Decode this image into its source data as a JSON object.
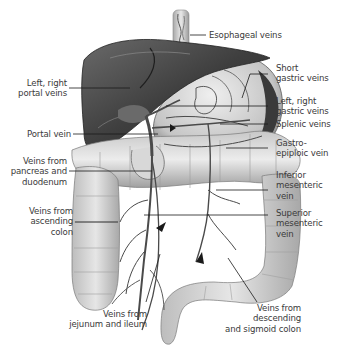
{
  "diagram": {
    "labels": {
      "esophageal": "Esophageal veins",
      "left_right_portal": "Left, right\nportal veins",
      "short_gastric": "Short\ngastric veins",
      "left_right_gastric": "Left, right\ngastric veins",
      "portal_vein": "Portal vein",
      "splenic": "Splenic veins",
      "pancreas_duodenum": "Veins from\npancreas and\nduodenum",
      "gastroepiploic": "Gastro-\nepiploic vein",
      "inferior_mesenteric": "Inferior\nmesenteric\nvein",
      "ascending_colon": "Veins from\nascending\ncolon",
      "superior_mesenteric": "Superior\nmesenteric\nvein",
      "jejunum_ileum": "Veins from\njejunum and ileum",
      "descending_sigmoid": "Veins from\ndescending\nand sigmoid colon"
    },
    "colors": {
      "label_text": "#3a3a3a",
      "leader_line": "#1a1a1a",
      "liver": "#4a4a4a",
      "organ_light": "#d4d4d4",
      "vein": "#5a5a5a"
    }
  }
}
